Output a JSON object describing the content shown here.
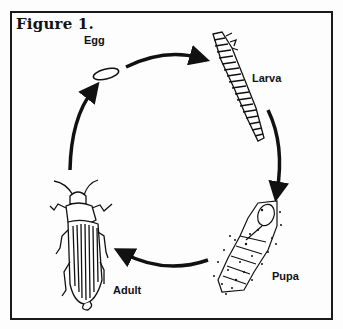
{
  "figure": {
    "title": "Figure 1.",
    "type": "life-cycle diagram",
    "stages": [
      {
        "id": "egg",
        "label": "Egg"
      },
      {
        "id": "larva",
        "label": "Larva"
      },
      {
        "id": "pupa",
        "label": "Pupa"
      },
      {
        "id": "adult",
        "label": "Adult"
      }
    ],
    "cycle_order": [
      "Egg",
      "Larva",
      "Pupa",
      "Adult",
      "Egg"
    ],
    "colors": {
      "ink": "#111111",
      "background": "#fdfdfd"
    }
  }
}
